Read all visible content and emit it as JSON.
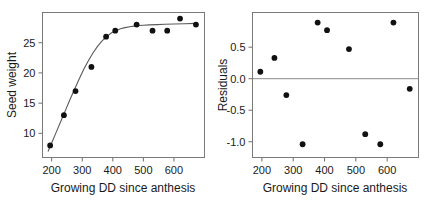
{
  "figure": {
    "background": "#ffffff",
    "point_color": "#111111",
    "curve_color": "#5a5a5a",
    "frame_color": "#7a7a7a"
  },
  "chart_data": [
    {
      "type": "scatter",
      "panel": "left",
      "title": "",
      "xlabel": "Growing DD since anthesis",
      "ylabel": "Seed weight",
      "xlim": [
        170,
        700
      ],
      "ylim": [
        6.0,
        30.0
      ],
      "xticks": [
        200,
        300,
        400,
        500,
        600
      ],
      "xticklabels": [
        "200",
        "300",
        "400",
        "500",
        "600"
      ],
      "yticks": [
        10,
        15,
        20,
        25
      ],
      "yticklabels": [
        "10",
        "15",
        "20",
        "25"
      ],
      "grid": false,
      "legend": "none",
      "x": [
        195,
        240,
        278,
        330,
        378,
        408,
        478,
        530,
        578,
        620,
        672
      ],
      "y": [
        8.0,
        13.0,
        17.0,
        21.0,
        26.0,
        27.0,
        28.0,
        27.0,
        27.0,
        29.0,
        28.0
      ],
      "fit_curve": {
        "name": "fitted sigmoid",
        "x": [
          188,
          200,
          215,
          230,
          245,
          260,
          275,
          290,
          305,
          320,
          335,
          350,
          365,
          380,
          395,
          410,
          425,
          440,
          455,
          470,
          485,
          500,
          520,
          545,
          570,
          600,
          635,
          672
        ],
        "y": [
          7.0,
          8.4,
          10.2,
          12.0,
          13.8,
          15.6,
          17.3,
          19.0,
          20.6,
          22.0,
          23.3,
          24.4,
          25.3,
          26.0,
          26.6,
          27.0,
          27.3,
          27.5,
          27.65,
          27.75,
          27.85,
          27.9,
          27.95,
          28.0,
          28.05,
          28.1,
          28.15,
          28.2
        ]
      }
    },
    {
      "type": "scatter",
      "panel": "right",
      "title": "",
      "xlabel": "Growing DD since anthesis",
      "ylabel": "Residuals",
      "xlim": [
        170,
        700
      ],
      "ylim": [
        -1.25,
        1.05
      ],
      "xticks": [
        200,
        300,
        400,
        500,
        600
      ],
      "xticklabels": [
        "200",
        "300",
        "400",
        "500",
        "600"
      ],
      "yticks": [
        0.5,
        0.0,
        -0.5,
        -1.0
      ],
      "yticklabels": [
        "0.5",
        "0.0",
        "-0.5",
        "-1.0"
      ],
      "grid": false,
      "legend": "none",
      "reference_line": 0.0,
      "x": [
        195,
        240,
        278,
        330,
        378,
        408,
        478,
        530,
        578,
        620,
        672
      ],
      "y": [
        0.11,
        0.33,
        -0.26,
        -1.04,
        0.89,
        0.77,
        0.47,
        -0.88,
        -1.04,
        0.89,
        -0.16
      ]
    }
  ]
}
